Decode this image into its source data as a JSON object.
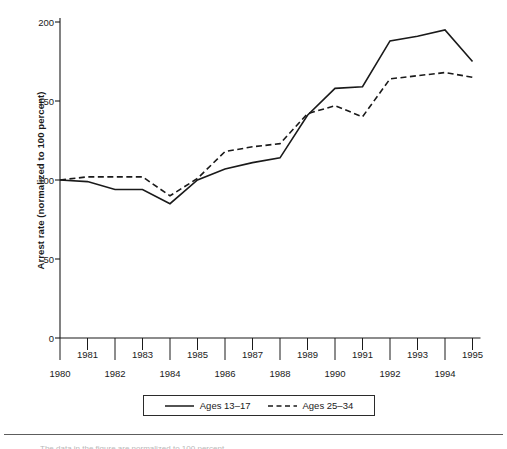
{
  "chart_data": {
    "type": "line",
    "title": "",
    "xlabel": "",
    "ylabel": "Arrest rate (normalized to 100 percent)",
    "x": [
      1980,
      1981,
      1982,
      1983,
      1984,
      1985,
      1986,
      1987,
      1988,
      1989,
      1990,
      1991,
      1992,
      1993,
      1994,
      1995
    ],
    "xlim": [
      1980,
      1995
    ],
    "ylim": [
      0,
      200
    ],
    "yticks": [
      0,
      50,
      100,
      150,
      200
    ],
    "ytick_labels": [
      "0",
      "50",
      "100",
      "150",
      "200"
    ],
    "xticks": [
      1980,
      1981,
      1982,
      1983,
      1984,
      1985,
      1986,
      1987,
      1988,
      1989,
      1990,
      1991,
      1992,
      1993,
      1994,
      1995
    ],
    "xtick_labels_upper": [
      "1981",
      "1983",
      "1985",
      "1987",
      "1989",
      "1991",
      "1993",
      "1995"
    ],
    "xtick_labels_lower": [
      "1980",
      "1982",
      "1984",
      "1986",
      "1988",
      "1990",
      "1992",
      "1994"
    ],
    "grid": false,
    "legend_position": "below-axis-center",
    "series": [
      {
        "name": "Ages 13–17",
        "style": "solid",
        "color": "#1a1a1a",
        "values": [
          100,
          99,
          94,
          94,
          85,
          100,
          107,
          111,
          114,
          141,
          158,
          159,
          188,
          191,
          195,
          175
        ]
      },
      {
        "name": "Ages 25–34",
        "style": "dashed",
        "color": "#1a1a1a",
        "values": [
          100,
          102,
          102,
          102,
          90,
          101,
          118,
          121,
          123,
          142,
          147,
          140,
          164,
          166,
          168,
          165
        ]
      }
    ]
  },
  "legend": {
    "entries": [
      {
        "label": "Ages 13–17",
        "style": "solid"
      },
      {
        "label": "Ages 25–34",
        "style": "dashed"
      }
    ]
  },
  "footer": {
    "caption_fragment": "The data in the figure are normalized to 100 percent"
  }
}
